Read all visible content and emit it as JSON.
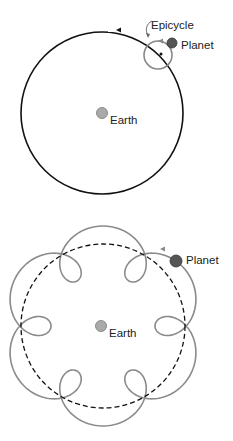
{
  "top_diagram": {
    "title": "Deferent and epicycle",
    "labels": {
      "epicycle": "Epicycle",
      "planet": "Planet",
      "earth": "Earth"
    }
  },
  "bottom_diagram": {
    "title": "Resulting retrograde loops",
    "labels": {
      "planet": "Planet",
      "earth": "Earth"
    },
    "loop_count": 6
  },
  "colors": {
    "deferent": "#111111",
    "epicycle": "#888888",
    "planet": "#555555",
    "earth": "#aaaaaa",
    "path": "#8a8a8a"
  }
}
